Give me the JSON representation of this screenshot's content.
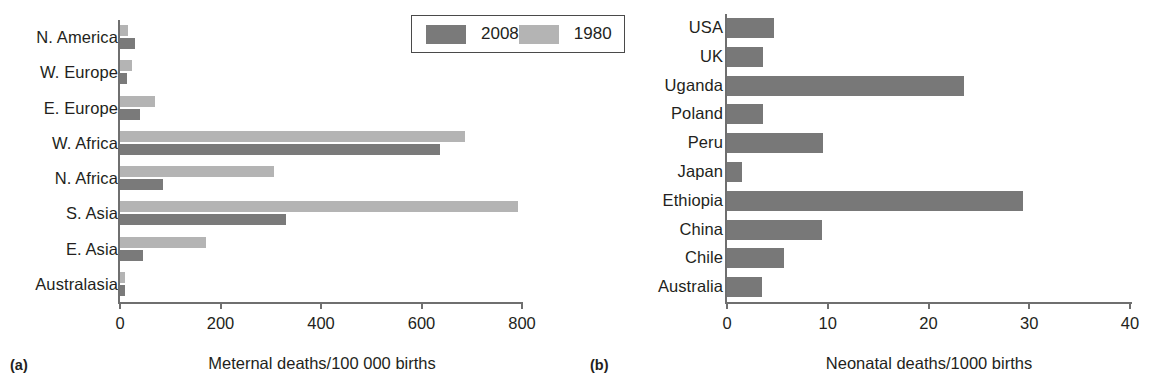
{
  "figure": {
    "panels": [
      {
        "tag": "(a)",
        "axis_title": "Meternal deaths/100 000 births",
        "legend": {
          "items": [
            {
              "label": "2008",
              "color": "#7a7a7a",
              "series_key": "s2008"
            },
            {
              "label": "1980",
              "color": "#b4b4b4",
              "series_key": "s1980"
            }
          ]
        }
      },
      {
        "tag": "(b)",
        "axis_title": "Neonatal deaths/1000 births",
        "legend": null
      }
    ]
  },
  "chart_data": [
    {
      "type": "bar",
      "orientation": "horizontal",
      "panel": "(a)",
      "title": "",
      "xlabel": "Meternal deaths/100 000 births",
      "ylabel": "",
      "xlim": [
        0,
        800
      ],
      "xticks": [
        0,
        200,
        400,
        600,
        800
      ],
      "xticklabels": [
        "0",
        "200",
        "400",
        "600",
        "800"
      ],
      "grid": false,
      "legend_position": "top-right",
      "categories": [
        "N. America",
        "W. Europe",
        "E. Europe",
        "W. Africa",
        "N. Africa",
        "S. Asia",
        "E. Asia",
        "Australasia"
      ],
      "series": [
        {
          "name": "1980",
          "color": "#b4b4b4",
          "values": [
            16,
            24,
            70,
            686,
            306,
            792,
            171,
            10
          ]
        },
        {
          "name": "2008",
          "color": "#7a7a7a",
          "values": [
            30,
            14,
            40,
            637,
            85,
            330,
            46,
            9
          ]
        }
      ]
    },
    {
      "type": "bar",
      "orientation": "horizontal",
      "panel": "(b)",
      "title": "",
      "xlabel": "Neonatal deaths/1000 births",
      "ylabel": "",
      "xlim": [
        0,
        40
      ],
      "xticks": [
        0,
        10,
        20,
        30,
        40
      ],
      "xticklabels": [
        "0",
        "10",
        "20",
        "30",
        "40"
      ],
      "grid": false,
      "legend_position": "none",
      "categories": [
        "USA",
        "UK",
        "Uganda",
        "Poland",
        "Peru",
        "Japan",
        "Ethiopia",
        "China",
        "Chile",
        "Australia"
      ],
      "series": [
        {
          "name": "Neonatal deaths",
          "color": "#787878",
          "values": [
            4.7,
            3.6,
            23.5,
            3.6,
            9.5,
            1.5,
            29.4,
            9.4,
            5.7,
            3.5
          ]
        }
      ]
    }
  ]
}
